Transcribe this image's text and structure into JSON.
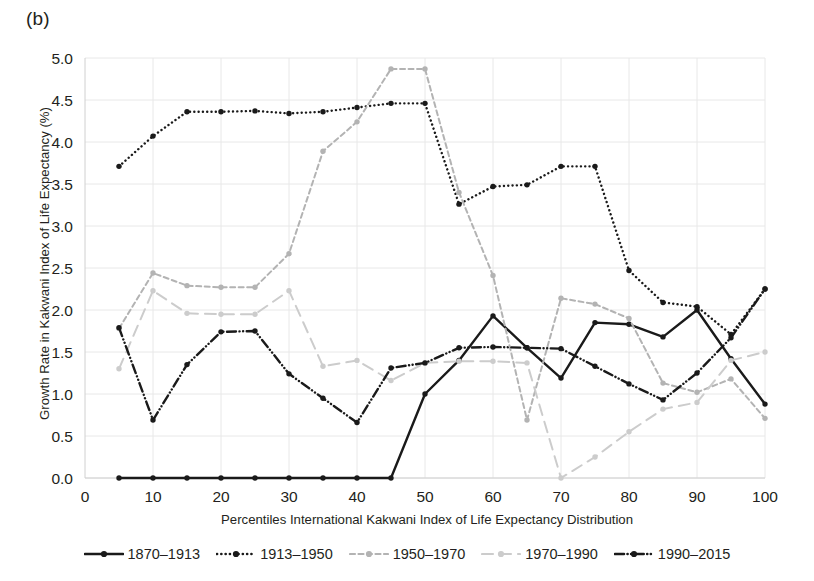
{
  "panel": {
    "label": "(b)"
  },
  "chart_data": {
    "type": "line",
    "title": "",
    "subtitle": "",
    "xlabel": "Percentiles International Kakwani Index of Life Expectancy Distribution",
    "ylabel": "Growth Rate in Kakwani Index of Life Expectancy (%)",
    "xlim": [
      0,
      100
    ],
    "ylim": [
      0.0,
      5.0
    ],
    "xticks": [
      0,
      10,
      20,
      30,
      40,
      50,
      60,
      70,
      80,
      90,
      100
    ],
    "xtick_labels": [
      "0",
      "10",
      "20",
      "30",
      "40",
      "50",
      "60",
      "70",
      "80",
      "90",
      "100"
    ],
    "yticks": [
      0.0,
      0.5,
      1.0,
      1.5,
      2.0,
      2.5,
      3.0,
      3.5,
      4.0,
      4.5,
      5.0
    ],
    "ytick_labels": [
      "0.0",
      "0.5",
      "1.0",
      "1.5",
      "2.0",
      "2.5",
      "3.0",
      "3.5",
      "4.0",
      "4.5",
      "5.0"
    ],
    "grid": true,
    "grid_color": "#e8e8e8",
    "legend_position": "bottom",
    "x": [
      5,
      10,
      15,
      20,
      25,
      30,
      35,
      40,
      45,
      50,
      55,
      60,
      65,
      70,
      75,
      80,
      85,
      90,
      95,
      100
    ],
    "series": [
      {
        "name": "1870–1913",
        "color": "#1a1a1a",
        "dash": "solid",
        "marker": "circle",
        "values": [
          0.0,
          0.0,
          0.0,
          0.0,
          0.0,
          0.0,
          0.0,
          0.0,
          0.0,
          1.0,
          1.4,
          1.93,
          1.55,
          1.19,
          1.85,
          1.83,
          1.68,
          2.0,
          1.42,
          0.88
        ]
      },
      {
        "name": "1913–1950",
        "color": "#1a1a1a",
        "dash": "dotted",
        "marker": "circle",
        "values": [
          3.71,
          4.07,
          4.36,
          4.36,
          4.37,
          4.34,
          4.36,
          4.41,
          4.46,
          4.46,
          3.26,
          3.47,
          3.49,
          3.71,
          3.71,
          2.47,
          2.09,
          2.04,
          1.71,
          2.25
        ]
      },
      {
        "name": "1950–1970",
        "color": "#b3b3b3",
        "dash": "dashed-short",
        "marker": "circle",
        "values": [
          1.78,
          2.44,
          2.29,
          2.27,
          2.27,
          2.67,
          3.89,
          4.24,
          4.87,
          4.87,
          3.4,
          2.41,
          0.69,
          2.14,
          2.07,
          1.9,
          1.13,
          1.02,
          1.18,
          0.71
        ]
      },
      {
        "name": "1970–1990",
        "color": "#cccccc",
        "dash": "dashed-long",
        "marker": "circle",
        "values": [
          1.3,
          2.23,
          1.96,
          1.95,
          1.95,
          2.23,
          1.33,
          1.4,
          1.16,
          1.37,
          1.39,
          1.39,
          1.37,
          0.0,
          0.25,
          0.55,
          0.82,
          0.9,
          1.4,
          1.5
        ]
      },
      {
        "name": "1990–2015",
        "color": "#1a1a1a",
        "dash": "dash-dot-dot",
        "marker": "circle",
        "values": [
          1.79,
          0.69,
          1.35,
          1.74,
          1.75,
          1.24,
          0.95,
          0.66,
          1.31,
          1.37,
          1.55,
          1.56,
          1.55,
          1.54,
          1.33,
          1.12,
          0.93,
          1.25,
          1.67,
          2.25
        ]
      }
    ]
  },
  "legend": {
    "entries": [
      {
        "label": "1870–1913"
      },
      {
        "label": "1913–1950"
      },
      {
        "label": "1950–1970"
      },
      {
        "label": "1970–1990"
      },
      {
        "label": "1990–2015"
      }
    ]
  }
}
